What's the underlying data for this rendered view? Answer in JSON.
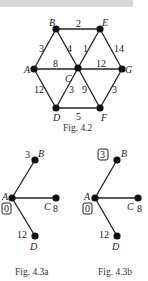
{
  "figures": [
    {
      "caption": "Fig. 4.2",
      "nodes": [
        {
          "id": "A",
          "x": 34,
          "y": 69
        },
        {
          "id": "B",
          "x": 56,
          "y": 29
        },
        {
          "id": "C",
          "x": 78,
          "y": 68
        },
        {
          "id": "D",
          "x": 56,
          "y": 108
        },
        {
          "id": "E",
          "x": 100,
          "y": 29
        },
        {
          "id": "F",
          "x": 100,
          "y": 108
        },
        {
          "id": "G",
          "x": 122,
          "y": 69
        }
      ],
      "edges": [
        {
          "from": "A",
          "to": "B",
          "weight": "3"
        },
        {
          "from": "B",
          "to": "E",
          "weight": "2"
        },
        {
          "from": "B",
          "to": "C",
          "weight": "4"
        },
        {
          "from": "C",
          "to": "E",
          "weight": "1"
        },
        {
          "from": "E",
          "to": "G",
          "weight": "14"
        },
        {
          "from": "A",
          "to": "C",
          "weight": "8"
        },
        {
          "from": "C",
          "to": "G",
          "weight": "12"
        },
        {
          "from": "A",
          "to": "D",
          "weight": "12"
        },
        {
          "from": "C",
          "to": "D",
          "weight": "3"
        },
        {
          "from": "C",
          "to": "F",
          "weight": "9"
        },
        {
          "from": "G",
          "to": "F",
          "weight": "3"
        },
        {
          "from": "D",
          "to": "F",
          "weight": "5"
        }
      ]
    },
    {
      "caption": "Fig. 4.3a",
      "nodes": [
        {
          "id": "A",
          "label_value": "0",
          "boxed": true
        },
        {
          "id": "B",
          "label_value": "3",
          "boxed": false
        },
        {
          "id": "C",
          "label_value": "8",
          "boxed": false
        },
        {
          "id": "D",
          "label_value": "12",
          "boxed": false
        }
      ]
    },
    {
      "caption": "Fig. 4.3b",
      "nodes": [
        {
          "id": "A",
          "label_value": "0",
          "boxed": true
        },
        {
          "id": "B",
          "label_value": "3",
          "boxed": true
        },
        {
          "id": "C",
          "label_value": "8",
          "boxed": false
        },
        {
          "id": "D",
          "label_value": "12",
          "boxed": false
        }
      ]
    }
  ]
}
